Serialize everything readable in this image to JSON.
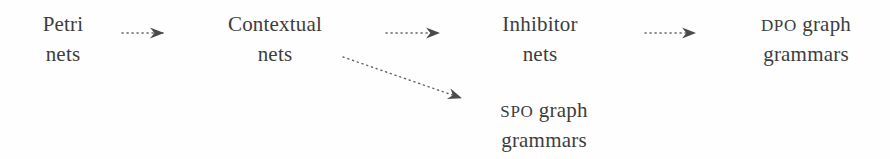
{
  "diagram": {
    "background_color": "#fefefe",
    "text_color": "#3d3d3d",
    "arrow_color": "#555555",
    "arrow_style": "dotted",
    "nodes": [
      {
        "id": "petri-nets",
        "line1": "Petri",
        "line2": "nets",
        "line1_smallcaps": false
      },
      {
        "id": "contextual-nets",
        "line1": "Contextual",
        "line2": "nets",
        "line1_smallcaps": false
      },
      {
        "id": "inhibitor-nets",
        "line1": "Inhibitor",
        "line2": "nets",
        "line1_smallcaps": false
      },
      {
        "id": "dpo-graph-grammars",
        "line1_prefix": "DPO",
        "line1": " graph",
        "line2": "grammars",
        "line1_smallcaps": true
      },
      {
        "id": "spo-graph-grammars",
        "line1_prefix": "SPO",
        "line1": " graph",
        "line2": "grammars",
        "line1_smallcaps": true
      }
    ],
    "edges": [
      {
        "id": "petri-to-contextual",
        "from": "petri-nets",
        "to": "contextual-nets",
        "x1": 122,
        "y1": 33,
        "x2": 170,
        "y2": 33
      },
      {
        "id": "contextual-to-inhibitor",
        "from": "contextual-nets",
        "to": "inhibitor-nets",
        "x1": 386,
        "y1": 33,
        "x2": 446,
        "y2": 33
      },
      {
        "id": "inhibitor-to-dpo",
        "from": "inhibitor-nets",
        "to": "dpo-graph-grammars",
        "x1": 645,
        "y1": 33,
        "x2": 702,
        "y2": 33
      },
      {
        "id": "contextual-to-spo",
        "from": "contextual-nets",
        "to": "spo-graph-grammars",
        "x1": 343,
        "y1": 57,
        "x2": 468,
        "y2": 100
      }
    ]
  }
}
